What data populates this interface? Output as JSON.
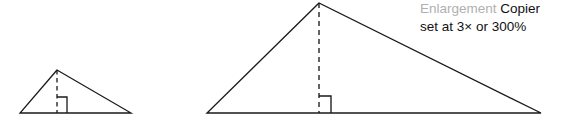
{
  "figure": {
    "background_color": "#ffffff",
    "stroke_color": "#1a1a1a",
    "annotation": {
      "line1_part1": "Enlargement",
      "line1_part1_color": "#b0b0b0",
      "line1_part2": "Copier",
      "line1_part2_color": "#111111",
      "line2": "set at 3× or 300%",
      "line2_color": "#111111"
    },
    "small_triangle": {
      "name": "original-triangle",
      "apex": [
        57,
        70
      ],
      "base_left": [
        20,
        113
      ],
      "base_right": [
        131,
        113
      ],
      "altitude_foot": [
        57,
        113
      ],
      "altitude_style": "dashed",
      "right_angle_marker": {
        "x": 57,
        "y": 97,
        "size": 10,
        "side": "right"
      }
    },
    "large_triangle": {
      "name": "enlarged-triangle",
      "apex": [
        319,
        3
      ],
      "base_left": [
        207,
        113
      ],
      "base_right": [
        541,
        113
      ],
      "altitude_foot": [
        319,
        113
      ],
      "altitude_style": "dashed",
      "right_angle_marker": {
        "x": 319,
        "y": 96,
        "size": 12,
        "side": "right"
      },
      "scale_factor": "3×"
    }
  }
}
